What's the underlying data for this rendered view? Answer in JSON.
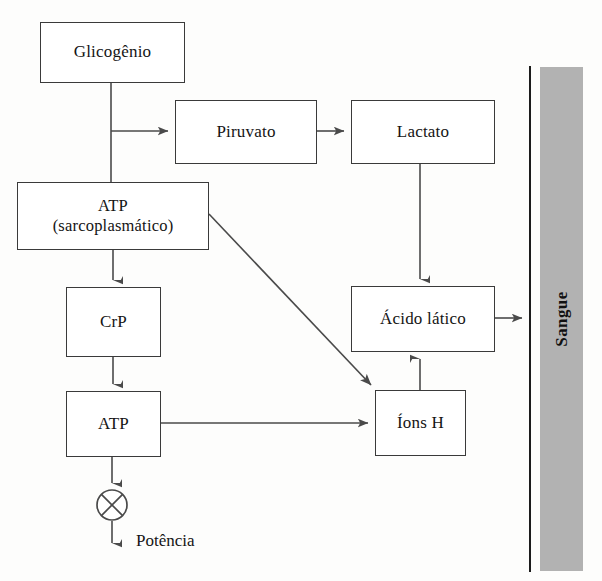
{
  "diagram": {
    "language": "pt-BR",
    "nodes": {
      "glicogenio": {
        "label": "Glicogênio"
      },
      "piruvato": {
        "label": "Piruvato"
      },
      "lactato": {
        "label": "Lactato"
      },
      "atp_sarcoplasmatico": {
        "label_line1": "ATP",
        "label_line2": "(sarcoplasmático)"
      },
      "crp": {
        "label": "CrP"
      },
      "atp": {
        "label": "ATP"
      },
      "acido_latico": {
        "label": "Ácido lático"
      },
      "ions_h": {
        "label": "Íons H"
      }
    },
    "blood": {
      "label": "Sangue",
      "bar_color": "#b2b2b2",
      "line_color": "#1c1c1c"
    },
    "output": {
      "label": "Potência",
      "symbol": "crossed-circle"
    },
    "colors": {
      "box_border": "#3a3a3a",
      "box_fill": "#ffffff",
      "connector": "#4a4a4a",
      "text": "#141414",
      "background": "#fdfdfc"
    },
    "edges": [
      {
        "from": "glicogenio",
        "to": "atp_sarcoplasmatico",
        "style": "orthogonal",
        "arrow": false
      },
      {
        "from": "glicogenio",
        "to": "piruvato",
        "style": "orthogonal",
        "arrow": true
      },
      {
        "from": "piruvato",
        "to": "lactato",
        "style": "straight",
        "arrow": true
      },
      {
        "from": "lactato",
        "to": "acido_latico",
        "style": "straight",
        "arrow": true
      },
      {
        "from": "atp_sarcoplasmatico",
        "to": "crp",
        "style": "straight",
        "arrow": true
      },
      {
        "from": "atp_sarcoplasmatico",
        "to": "ions_h",
        "style": "diagonal",
        "arrow": true
      },
      {
        "from": "crp",
        "to": "atp",
        "style": "straight",
        "arrow": true
      },
      {
        "from": "atp",
        "to": "ions_h",
        "style": "straight",
        "arrow": true
      },
      {
        "from": "atp",
        "to": "output",
        "style": "straight",
        "arrow": true
      },
      {
        "from": "ions_h",
        "to": "acido_latico",
        "style": "straight",
        "arrow": true
      },
      {
        "from": "acido_latico",
        "to": "blood",
        "style": "straight",
        "arrow": true
      }
    ]
  }
}
